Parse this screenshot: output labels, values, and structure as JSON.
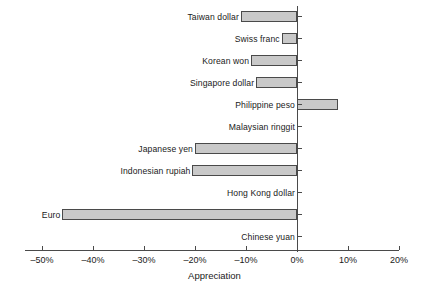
{
  "chart_data": {
    "type": "bar",
    "orientation": "horizontal",
    "title": "",
    "xlabel": "Appreciation",
    "ylabel": "",
    "xlim": [
      -50,
      20
    ],
    "xticks": [
      -50,
      -40,
      -30,
      -20,
      -10,
      0,
      10,
      20
    ],
    "xtick_labels": [
      "–50%",
      "–40%",
      "–30%",
      "–20%",
      "–10%",
      "0%",
      "10%",
      "20%"
    ],
    "grid": false,
    "legend": null,
    "units": "percent",
    "categories": [
      "Taiwan dollar",
      "Swiss franc",
      "Korean won",
      "Singapore dollar",
      "Philippine peso",
      "Malaysian ringgit",
      "Japanese yen",
      "Indonesian rupiah",
      "Hong Kong dollar",
      "Euro",
      "Chinese yuan"
    ],
    "values": [
      -11,
      -3,
      -9,
      -8,
      8,
      0,
      -20,
      -20.5,
      0,
      -46,
      0
    ],
    "bars": [
      {
        "label": "Taiwan dollar",
        "value": -11
      },
      {
        "label": "Swiss franc",
        "value": -3
      },
      {
        "label": "Korean won",
        "value": -9
      },
      {
        "label": "Singapore dollar",
        "value": -8
      },
      {
        "label": "Philippine peso",
        "value": 8
      },
      {
        "label": "Malaysian ringgit",
        "value": 0
      },
      {
        "label": "Japanese yen",
        "value": -20
      },
      {
        "label": "Indonesian rupiah",
        "value": -20.5
      },
      {
        "label": "Hong Kong dollar",
        "value": 0
      },
      {
        "label": "Euro",
        "value": -46
      },
      {
        "label": "Chinese yuan",
        "value": 0
      }
    ],
    "colors": {
      "bar_fill": "#c9c9c9",
      "bar_edge": "#4a4a4a",
      "axis": "#4a4a4a",
      "text": "#1a1a1a",
      "background": "#ffffff"
    }
  }
}
